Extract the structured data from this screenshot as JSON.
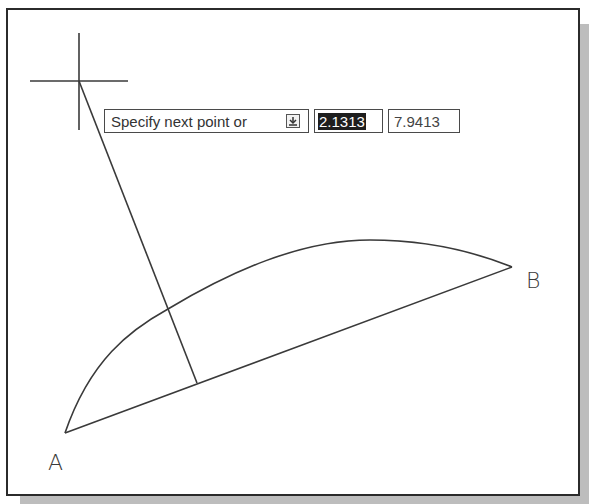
{
  "drawing": {
    "points": {
      "A": {
        "label": "A",
        "x": 65,
        "y": 433
      },
      "B": {
        "label": "B",
        "x": 512,
        "y": 267
      }
    },
    "crosshair": {
      "x": 79,
      "y": 81
    },
    "rubberband_end": {
      "x": 197,
      "y": 383
    },
    "arc_intersection": {
      "x": 168,
      "y": 309
    }
  },
  "dynamic_input": {
    "prompt": "Specify next point or",
    "options_icon": "down-arrow-options-icon",
    "x_value": "2.1313",
    "y_value": "7.9413"
  },
  "colors": {
    "line": "#3a3a3a",
    "frame": "#2b2b2b",
    "shadow": "#bdbdbd",
    "selection_bg": "#1e1e1e"
  }
}
